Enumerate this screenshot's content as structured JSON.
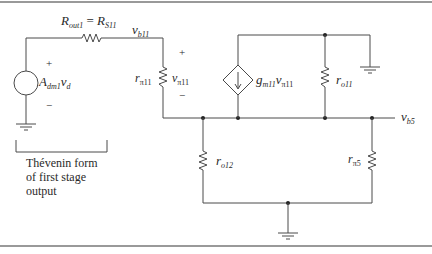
{
  "figure": {
    "type": "small-signal equivalent circuit",
    "labels": {
      "r_out1": {
        "main": "R",
        "sub": "out1",
        "eq": " = ",
        "main2": "R",
        "sub2": "S11"
      },
      "v_b11": {
        "main": "v",
        "sub": "b11"
      },
      "plus_vpi11": "+",
      "minus_vpi11": "−",
      "r_pi11": {
        "main": "r",
        "sub": "π11"
      },
      "v_pi11": {
        "main": "v",
        "sub": "π11"
      },
      "plus_src": "+",
      "minus_src": "−",
      "a_dm1": {
        "main": "A",
        "sub": "dm1",
        "main2": "v",
        "sub2": "d"
      },
      "gm11": {
        "main": "g",
        "sub": "m11",
        "main2": "v",
        "sub2": "π11"
      },
      "r_o11": {
        "main": "r",
        "sub": "o11"
      },
      "v_b5": {
        "main": "v",
        "sub": "b5"
      },
      "r_o12": {
        "main": "r",
        "sub": "o12"
      },
      "r_pi5": {
        "main": "r",
        "sub": "π5"
      }
    },
    "caption": {
      "line1": "Thévenin form",
      "line2": "of first stage",
      "line3": "output"
    },
    "colors": {
      "wire": "#4a4a4a",
      "text": "#2a2a2a",
      "border": "#777777"
    }
  }
}
